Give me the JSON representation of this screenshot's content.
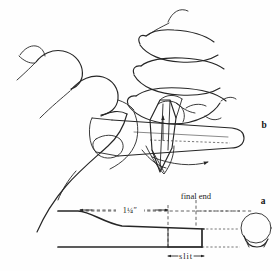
{
  "figure": {
    "panels": [
      {
        "key": "b",
        "key_label": "b",
        "name": "hands-cutting-reed",
        "description": "Two hands holding a cane reed while a knife blade cuts a lengthwise slit",
        "annotations": [
          {
            "name": "blade-up-arrow",
            "glyph": "arrow-up"
          },
          {
            "name": "reed-pull-arrow",
            "glyph": "arrow-right"
          }
        ]
      },
      {
        "key": "a",
        "key_label": "a",
        "name": "reed-side-diagram",
        "description": "Side elevation of the reed with dimensions plus an end-on cross section",
        "labels": {
          "length_dimension": "1¼″",
          "final_end": "final end",
          "slit": "slit"
        },
        "annotations": [
          {
            "name": "length-dimension-arrow-left",
            "glyph": "arrow-left"
          },
          {
            "name": "length-dimension-arrow-right",
            "glyph": "arrow-right"
          },
          {
            "name": "slit-dimension-arrow-left",
            "glyph": "arrow-left"
          },
          {
            "name": "slit-dimension-arrow-right",
            "glyph": "arrow-right"
          }
        ],
        "cross_section": {
          "name": "reed-cross-section",
          "description": "Circular tube cross-section with slit gap at the bottom"
        }
      }
    ],
    "colors": {
      "ink": "#262626",
      "dashed_guide": "#3b3b3b",
      "paper": "#fefefe"
    }
  }
}
